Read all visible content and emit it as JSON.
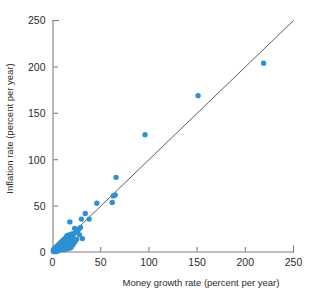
{
  "chart_data": {
    "type": "scatter",
    "title": "",
    "xlabel": "Money growth rate (percent per year)",
    "ylabel": "Inflation rate (percent per year)",
    "xlim": [
      0,
      250
    ],
    "ylim": [
      0,
      250
    ],
    "xticks": [
      0,
      50,
      100,
      150,
      200,
      250
    ],
    "yticks": [
      0,
      50,
      100,
      150,
      200,
      250
    ],
    "xtick_labels": [
      "0",
      "50",
      "100",
      "150",
      "200",
      "250"
    ],
    "ytick_labels": [
      "0",
      "50",
      "100",
      "150",
      "200",
      "250"
    ],
    "grid": false,
    "legend": null,
    "marker_color": "#2e90d0",
    "line_color": "#4a4a4a",
    "axis_color": "#7d7d7d",
    "reference_line": {
      "label": "",
      "description": "45-degree line where inflation equals money growth",
      "x": [
        0,
        250
      ],
      "y": [
        0,
        250
      ]
    },
    "series": [
      {
        "name": "Countries",
        "points": [
          [
            219,
            204
          ],
          [
            151,
            169
          ],
          [
            96,
            127
          ],
          [
            66,
            81
          ],
          [
            65,
            62
          ],
          [
            63,
            61
          ],
          [
            62,
            54
          ],
          [
            46,
            53
          ],
          [
            38,
            36
          ],
          [
            34,
            42
          ],
          [
            31,
            15
          ],
          [
            30,
            36
          ],
          [
            27,
            25
          ],
          [
            26,
            23
          ],
          [
            24,
            22
          ],
          [
            23,
            26
          ],
          [
            22,
            20
          ],
          [
            21,
            18
          ],
          [
            20,
            20
          ],
          [
            20,
            14
          ],
          [
            19,
            17
          ],
          [
            18,
            33
          ],
          [
            18,
            16
          ],
          [
            17,
            19
          ],
          [
            17,
            13
          ],
          [
            16,
            17
          ],
          [
            16,
            12
          ],
          [
            15,
            18
          ],
          [
            15,
            14
          ],
          [
            15,
            10
          ],
          [
            14,
            16
          ],
          [
            14,
            13
          ],
          [
            14,
            9
          ],
          [
            13,
            15
          ],
          [
            13,
            12
          ],
          [
            13,
            8
          ],
          [
            12,
            14
          ],
          [
            12,
            11
          ],
          [
            12,
            7
          ],
          [
            11,
            13
          ],
          [
            11,
            10
          ],
          [
            11,
            6
          ],
          [
            10,
            12
          ],
          [
            10,
            9
          ],
          [
            10,
            5
          ],
          [
            9,
            11
          ],
          [
            9,
            8
          ],
          [
            9,
            4
          ],
          [
            8,
            10
          ],
          [
            8,
            7
          ],
          [
            8,
            3
          ],
          [
            7,
            9
          ],
          [
            7,
            6
          ],
          [
            7,
            3
          ],
          [
            6,
            8
          ],
          [
            6,
            5
          ],
          [
            6,
            2
          ],
          [
            5,
            7
          ],
          [
            5,
            4
          ],
          [
            5,
            2
          ],
          [
            4,
            6
          ],
          [
            4,
            3
          ],
          [
            4,
            1
          ],
          [
            3,
            5
          ],
          [
            3,
            3
          ],
          [
            3,
            1
          ],
          [
            2,
            4
          ],
          [
            2,
            2
          ],
          [
            2,
            1
          ],
          [
            1,
            3
          ],
          [
            1,
            2
          ],
          [
            1,
            1
          ],
          [
            13,
            4
          ],
          [
            16,
            4
          ],
          [
            19,
            5
          ],
          [
            21,
            8
          ],
          [
            23,
            11
          ],
          [
            25,
            14
          ],
          [
            17,
            6
          ],
          [
            14,
            4
          ],
          [
            12,
            3
          ],
          [
            20,
            9
          ],
          [
            22,
            13
          ],
          [
            18,
            8
          ],
          [
            16,
            7
          ],
          [
            28,
            19
          ],
          [
            29,
            27
          ]
        ]
      }
    ]
  },
  "axes": {
    "x_title": "Money growth rate (percent per year)",
    "y_title": "Inflation rate (percent per year)"
  }
}
